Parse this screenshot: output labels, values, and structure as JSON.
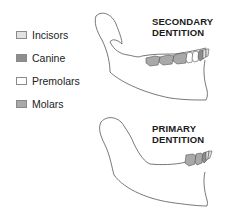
{
  "legend": {
    "items": [
      {
        "label": "Incisors",
        "color": "#e2e2e2"
      },
      {
        "label": "Canine",
        "color": "#8e8e8e"
      },
      {
        "label": "Premolars",
        "color": "#ffffff"
      },
      {
        "label": "Molars",
        "color": "#a9a9a9"
      }
    ]
  },
  "diagrams": {
    "secondary": {
      "title_line1": "SECONDARY",
      "title_line2": "DENTITION"
    },
    "primary": {
      "title_line1": "PRIMARY",
      "title_line2": "DENTITION"
    }
  }
}
